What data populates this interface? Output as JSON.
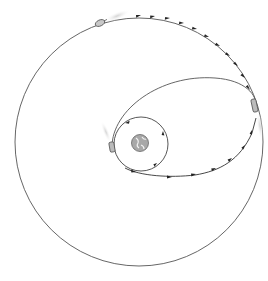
{
  "diagram": {
    "title": "",
    "type": "orbit-transfer",
    "colors": {
      "background": "#ffffff",
      "line": "#555555",
      "arrow": "#222222",
      "earth": "#9a9a9a",
      "plume": "#d8d8d8"
    },
    "elements": [
      {
        "name": "earth",
        "label": ""
      },
      {
        "name": "parking-orbit",
        "label": ""
      },
      {
        "name": "transfer-orbit",
        "label": ""
      },
      {
        "name": "target-orbit",
        "label": ""
      },
      {
        "name": "spacecraft-parking",
        "label": ""
      },
      {
        "name": "spacecraft-apogee",
        "label": ""
      },
      {
        "name": "spacecraft-target",
        "label": ""
      }
    ],
    "icons": [
      "earth-icon",
      "spacecraft-icon",
      "arrow-icon"
    ]
  }
}
